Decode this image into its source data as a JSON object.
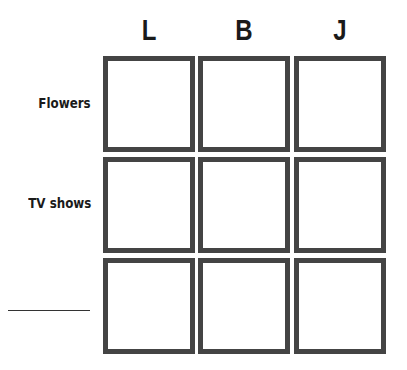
{
  "columns": [
    {
      "label": "L"
    },
    {
      "label": "B"
    },
    {
      "label": "J"
    }
  ],
  "rows": [
    {
      "label": "Flowers"
    },
    {
      "label": "TV shows"
    },
    {
      "label": ""
    }
  ],
  "colors": {
    "box_border": "#444444",
    "text": "#1a1a1a"
  }
}
